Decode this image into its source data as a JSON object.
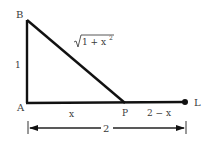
{
  "diagram": {
    "type": "geometry-triangle",
    "points": {
      "B": {
        "label": "B",
        "x": 27,
        "y": 20
      },
      "A": {
        "label": "A",
        "x": 27,
        "y": 103
      },
      "P": {
        "label": "P",
        "x": 125,
        "y": 103
      },
      "L": {
        "label": "L",
        "x": 185,
        "y": 102
      }
    },
    "segments": {
      "AB": {
        "label": "1"
      },
      "BP": {
        "label_sqrt": "1 + x",
        "label_exp": "2"
      },
      "AP": {
        "label": "x"
      },
      "PL": {
        "label": "2 − x"
      }
    },
    "dimension": {
      "label": "2",
      "from": "A",
      "to": "L"
    },
    "colors": {
      "stroke": "#111111",
      "text": "#3a3a3a"
    }
  }
}
